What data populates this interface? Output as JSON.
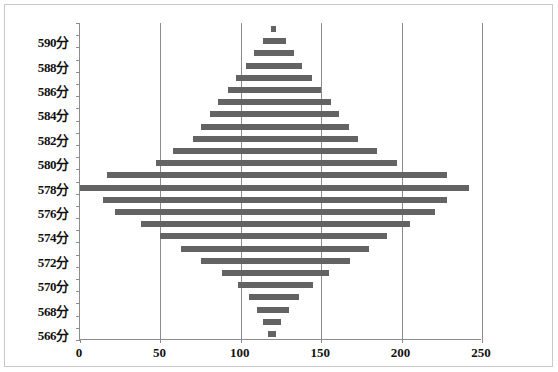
{
  "chart": {
    "type": "bar",
    "title": "",
    "xlabel": "",
    "ylabel": "",
    "bar_color": "#636363",
    "grid": "vertical",
    "axis_color": "#8c8c8c"
  },
  "axes": {
    "x": {
      "min": 0,
      "max": 250,
      "tick_step": 50,
      "ticks": [
        "0",
        "50",
        "100",
        "150",
        "200",
        "250"
      ]
    },
    "y": {
      "labels": [
        "590分",
        "588分",
        "586分",
        "584分",
        "582分",
        "580分",
        "578分",
        "576分",
        "574分",
        "572分",
        "570分",
        "568分",
        "566分"
      ]
    }
  },
  "chart_data": {
    "type": "bar",
    "subtype": "floating-range-bar",
    "title": "",
    "xlabel": "",
    "ylabel": "",
    "xlim": [
      0,
      250
    ],
    "ylim_labels": [
      "566分",
      "590分"
    ],
    "grid": "vertical-only",
    "legend": "none",
    "bar_color": "#636363",
    "categories": [
      "591分",
      "590分",
      "589分",
      "588分",
      "587分",
      "586分",
      "585分",
      "584分",
      "583分",
      "582分",
      "581分",
      "580分",
      "579分",
      "578分",
      "577分",
      "576分",
      "575分",
      "574分",
      "573分",
      "572分",
      "571分",
      "570分",
      "569分",
      "568分",
      "567分",
      "566分"
    ],
    "series": [
      {
        "name": "排名区间",
        "ranges": [
          {
            "category": "591分",
            "start": 119,
            "end": 122
          },
          {
            "category": "590分",
            "start": 114,
            "end": 128
          },
          {
            "category": "589分",
            "start": 108,
            "end": 133
          },
          {
            "category": "588分",
            "start": 103,
            "end": 138
          },
          {
            "category": "587分",
            "start": 97,
            "end": 144
          },
          {
            "category": "586分",
            "start": 92,
            "end": 150
          },
          {
            "category": "585分",
            "start": 86,
            "end": 156
          },
          {
            "category": "584分",
            "start": 81,
            "end": 161
          },
          {
            "category": "583分",
            "start": 75,
            "end": 167
          },
          {
            "category": "582分",
            "start": 70,
            "end": 173
          },
          {
            "category": "581分",
            "start": 58,
            "end": 185
          },
          {
            "category": "580分",
            "start": 47,
            "end": 197
          },
          {
            "category": "579分",
            "start": 17,
            "end": 228
          },
          {
            "category": "578分",
            "start": 0,
            "end": 242
          },
          {
            "category": "577分",
            "start": 14,
            "end": 228
          },
          {
            "category": "576分",
            "start": 22,
            "end": 221
          },
          {
            "category": "575分",
            "start": 38,
            "end": 205
          },
          {
            "category": "574分",
            "start": 50,
            "end": 191
          },
          {
            "category": "573分",
            "start": 63,
            "end": 180
          },
          {
            "category": "572分",
            "start": 75,
            "end": 168
          },
          {
            "category": "571分",
            "start": 88,
            "end": 155
          },
          {
            "category": "570分",
            "start": 98,
            "end": 145
          },
          {
            "category": "569分",
            "start": 105,
            "end": 136
          },
          {
            "category": "568分",
            "start": 110,
            "end": 130
          },
          {
            "category": "567分",
            "start": 114,
            "end": 125
          },
          {
            "category": "566分",
            "start": 117,
            "end": 122
          }
        ]
      }
    ]
  }
}
